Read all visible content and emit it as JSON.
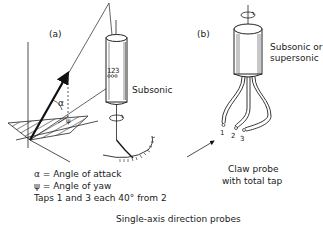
{
  "figure": {
    "caption": "Single-axis direction probes",
    "panel_a": {
      "label": "(a)",
      "probe_label": "Subsonic",
      "tap_numbers": [
        "1",
        "2",
        "3"
      ],
      "alpha_symbol": "α",
      "psi_symbol": "ψ",
      "legend": [
        "α = Angle of attack",
        "ψ = Angle of yaw",
        "Taps 1 and 3 each 40° from 2"
      ]
    },
    "panel_b": {
      "label": "(b)",
      "probe_label_line1": "Subsonic or",
      "probe_label_line2": "supersonic",
      "tap_numbers": [
        "1",
        "2",
        "3"
      ],
      "caption_line1": "Claw probe",
      "caption_line2": "with total tap"
    }
  }
}
